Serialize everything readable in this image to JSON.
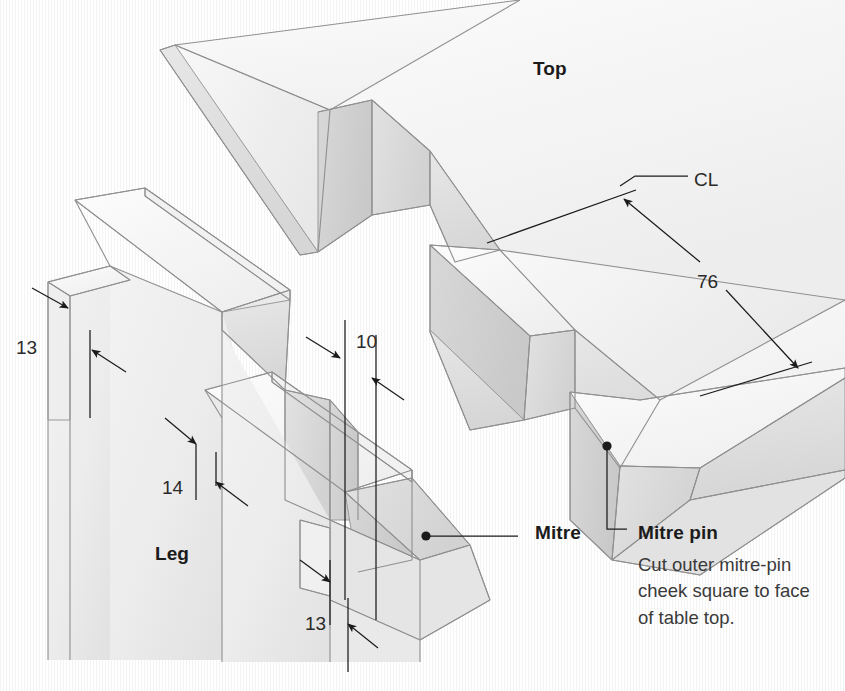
{
  "diagram": {
    "kind": "isometric-woodworking-joint-detail",
    "background_color": "#ffffff",
    "line_color": "#1b1b1b",
    "wood_light": "#f6f6f6",
    "wood_mid": "#ebebeb",
    "wood_shade": "#dcdcdc",
    "wood_dark": "#cfcfcf"
  },
  "part_labels": [
    {
      "id": "top",
      "text": "Top",
      "bold": true,
      "x": 533,
      "y": 59
    },
    {
      "id": "leg",
      "text": "Leg",
      "bold": true,
      "x": 155,
      "y": 544
    },
    {
      "id": "mitre",
      "text": "Mitre",
      "bold": true,
      "x": 535,
      "y": 523
    },
    {
      "id": "mitre-pin",
      "text": "Mitre pin",
      "bold": true,
      "x": 638,
      "y": 523
    }
  ],
  "dimensions": [
    {
      "id": "dim-13-upper",
      "value": "13",
      "x": 16,
      "y": 338
    },
    {
      "id": "dim-14",
      "value": "14",
      "x": 162,
      "y": 478
    },
    {
      "id": "dim-10",
      "value": "10",
      "x": 356,
      "y": 332
    },
    {
      "id": "dim-13-lower",
      "value": "13",
      "x": 305,
      "y": 614
    },
    {
      "id": "dim-76",
      "value": "76",
      "x": 697,
      "y": 272
    }
  ],
  "annotations": [
    {
      "id": "centerline-label",
      "text": "CL",
      "x": 694,
      "y": 170
    }
  ],
  "note": {
    "id": "mitre-pin-note",
    "lines": [
      "Cut outer mitre-pin",
      "cheek square to face",
      "of table top."
    ],
    "x": 638,
    "y": 552
  }
}
